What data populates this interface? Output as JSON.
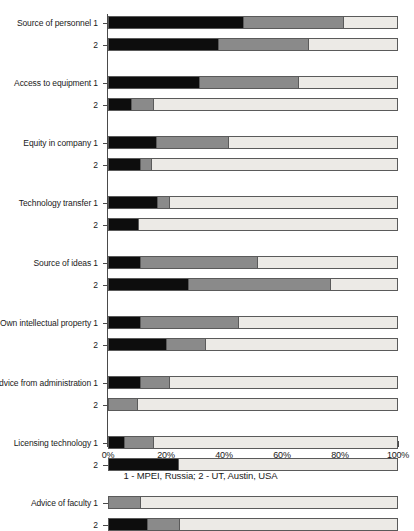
{
  "chart_data": {
    "type": "bar",
    "orientation": "horizontal",
    "stacked": true,
    "stack_mode": "percent",
    "title": "",
    "subtitle": "",
    "caption": "1 - MPEI, Russia; 2 - UT, Austin, USA",
    "xlabel": "",
    "ylabel": "",
    "xlim": [
      0,
      100
    ],
    "xticks": [
      0,
      20,
      40,
      60,
      80,
      100
    ],
    "xtick_labels": [
      "0%",
      "20%",
      "40%",
      "60%",
      "80%",
      "100%"
    ],
    "grid": false,
    "legend": "none",
    "series": [
      {
        "name": "segment-1",
        "color": "#0d0d0d"
      },
      {
        "name": "segment-2",
        "color": "#8a8a8a"
      },
      {
        "name": "segment-3",
        "color": "#eceae6"
      }
    ],
    "categories": [
      "Source of personnel",
      "Access to equipment",
      "Equity in company",
      "Technology transfer",
      "Source of ideas",
      "Own intellectual property",
      "Advice from administration",
      "Licensing technology",
      "Advice of faculty"
    ],
    "group_labels": [
      "1",
      "2"
    ],
    "groups": [
      {
        "category": "Source of personnel",
        "bars": [
          {
            "label": "1",
            "values": [
              46.5,
              34.5,
              19.0
            ]
          },
          {
            "label": "2",
            "values": [
              38.0,
              31.0,
              31.0
            ]
          }
        ]
      },
      {
        "category": "Access to equipment",
        "bars": [
          {
            "label": "1",
            "values": [
              31.5,
              34.0,
              34.5
            ]
          },
          {
            "label": "2",
            "values": [
              8.0,
              7.5,
              84.5
            ]
          }
        ]
      },
      {
        "category": "Equity in company",
        "bars": [
          {
            "label": "1",
            "values": [
              16.5,
              25.0,
              58.5
            ]
          },
          {
            "label": "2",
            "values": [
              11.0,
              4.0,
              85.0
            ]
          }
        ]
      },
      {
        "category": "Technology transfer",
        "bars": [
          {
            "label": "1",
            "values": [
              17.0,
              4.0,
              79.0
            ]
          },
          {
            "label": "2",
            "values": [
              10.5,
              0.0,
              89.5
            ]
          }
        ]
      },
      {
        "category": "Source of ideas",
        "bars": [
          {
            "label": "1",
            "values": [
              11.0,
              40.5,
              48.5
            ]
          },
          {
            "label": "2",
            "values": [
              27.5,
              49.0,
              23.5
            ]
          }
        ]
      },
      {
        "category": "Own intellectual property",
        "bars": [
          {
            "label": "1",
            "values": [
              11.0,
              34.0,
              55.0
            ]
          },
          {
            "label": "2",
            "values": [
              20.0,
              13.5,
              66.5
            ]
          }
        ]
      },
      {
        "category": "Advice from administration",
        "bars": [
          {
            "label": "1",
            "values": [
              11.0,
              10.0,
              79.0
            ]
          },
          {
            "label": "2",
            "values": [
              0.0,
              10.0,
              90.0
            ]
          }
        ]
      },
      {
        "category": "Licensing technology",
        "bars": [
          {
            "label": "1",
            "values": [
              5.5,
              10.0,
              84.5
            ]
          },
          {
            "label": "2",
            "values": [
              24.0,
              0.0,
              76.0
            ]
          }
        ]
      },
      {
        "category": "Advice of faculty",
        "bars": [
          {
            "label": "1",
            "values": [
              0.0,
              11.0,
              89.0
            ]
          },
          {
            "label": "2",
            "values": [
              13.5,
              11.0,
              75.5
            ]
          }
        ]
      }
    ]
  }
}
